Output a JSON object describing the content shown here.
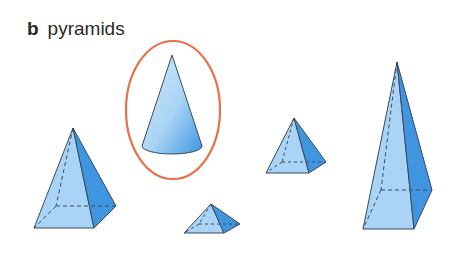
{
  "heading": {
    "letter": "b",
    "title": "pyramids"
  },
  "colors": {
    "face_light": "#a9d4f5",
    "face_mid": "#8cc4f0",
    "face_dark": "#3f95e0",
    "edge": "#3a4a5c",
    "highlight_ring": "#e8704a"
  },
  "shapes": [
    {
      "id": "pyramid-left",
      "kind": "square-pyramid",
      "circled": false
    },
    {
      "id": "cone",
      "kind": "cone",
      "circled": true
    },
    {
      "id": "pyramid-small-flat",
      "kind": "square-pyramid",
      "circled": false
    },
    {
      "id": "pyramid-medium",
      "kind": "square-pyramid",
      "circled": false
    },
    {
      "id": "pyramid-tall",
      "kind": "square-pyramid",
      "circled": false
    }
  ]
}
